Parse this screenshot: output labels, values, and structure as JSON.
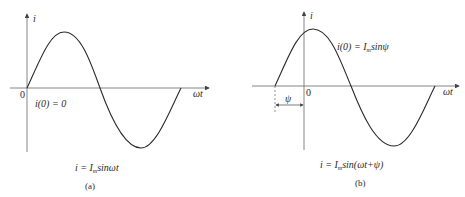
{
  "panels": [
    {
      "id": "a",
      "y_axis_label": "i",
      "x_axis_label": "ωt",
      "origin_label": "0",
      "initial_condition": "i(0) = 0",
      "equation": "i = I",
      "equation_sub": "m",
      "equation_rest": "sinωt",
      "caption": "(a)"
    },
    {
      "id": "b",
      "y_axis_label": "i",
      "x_axis_label": "ωt",
      "origin_label": "0",
      "initial_condition_pre": "i(0) = I",
      "initial_condition_sub": "m",
      "initial_condition_rest": "sinψ",
      "phase_label": "ψ",
      "equation": "i = I",
      "equation_sub": "m",
      "equation_rest": "sin(ωt+ψ)",
      "caption": "(b)"
    }
  ],
  "colors": {
    "line": "#2a2a2a",
    "axis": "#555555"
  }
}
